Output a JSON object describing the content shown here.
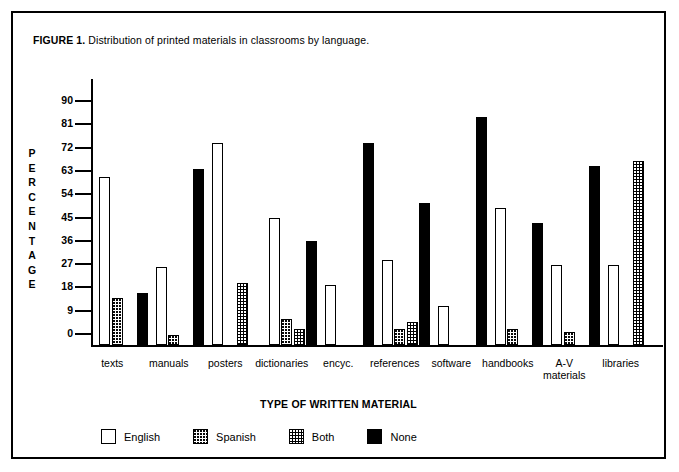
{
  "figure": {
    "label": "FIGURE 1.",
    "caption": " Distribution of printed materials in classrooms by language."
  },
  "chart_data": {
    "type": "bar",
    "title": "Distribution of printed materials in classrooms by language.",
    "xlabel": "TYPE OF WRITTEN MATERIAL",
    "ylabel": "PERCENTAGE",
    "ylim": [
      0,
      95
    ],
    "yticks": [
      0,
      9,
      18,
      27,
      36,
      45,
      54,
      63,
      72,
      81,
      90
    ],
    "ytick_labels": [
      "0",
      "9",
      "18",
      "27",
      "36",
      "45",
      "54",
      "63",
      "72",
      "81",
      "90"
    ],
    "grid": false,
    "legend_position": "bottom",
    "categories": [
      "texts",
      "manuals",
      "posters",
      "dictionaries",
      "encyc.",
      "references",
      "software",
      "handbooks",
      "A-V materials",
      "libraries"
    ],
    "category_labels": [
      [
        "texts"
      ],
      [
        "manuals"
      ],
      [
        "posters"
      ],
      [
        "dictionaries"
      ],
      [
        "encyc."
      ],
      [
        "references"
      ],
      [
        "software"
      ],
      [
        "handbooks"
      ],
      [
        "A-V",
        "materials"
      ],
      [
        "libraries"
      ]
    ],
    "series": [
      {
        "name": "English",
        "fill": "white",
        "values": [
          65,
          30,
          78,
          49,
          23,
          33,
          15,
          53,
          31,
          31
        ]
      },
      {
        "name": "Spanish",
        "fill": "light-dotted",
        "values": [
          18,
          4,
          0,
          10,
          0,
          6,
          0,
          6,
          5,
          0
        ]
      },
      {
        "name": "Both",
        "fill": "dark-dotted",
        "values": [
          0,
          0,
          24,
          6,
          0,
          9,
          0,
          0,
          0,
          71
        ]
      },
      {
        "name": "None",
        "fill": "black",
        "values": [
          20,
          68,
          0,
          40,
          78,
          55,
          88,
          47,
          69,
          0
        ]
      }
    ]
  },
  "legend": {
    "items": [
      {
        "label": "English",
        "fill": "english"
      },
      {
        "label": "Spanish",
        "fill": "spanish"
      },
      {
        "label": "Both",
        "fill": "both"
      },
      {
        "label": "None",
        "fill": "none"
      }
    ]
  },
  "colors": {
    "ink": "#000000",
    "background": "#ffffff"
  }
}
